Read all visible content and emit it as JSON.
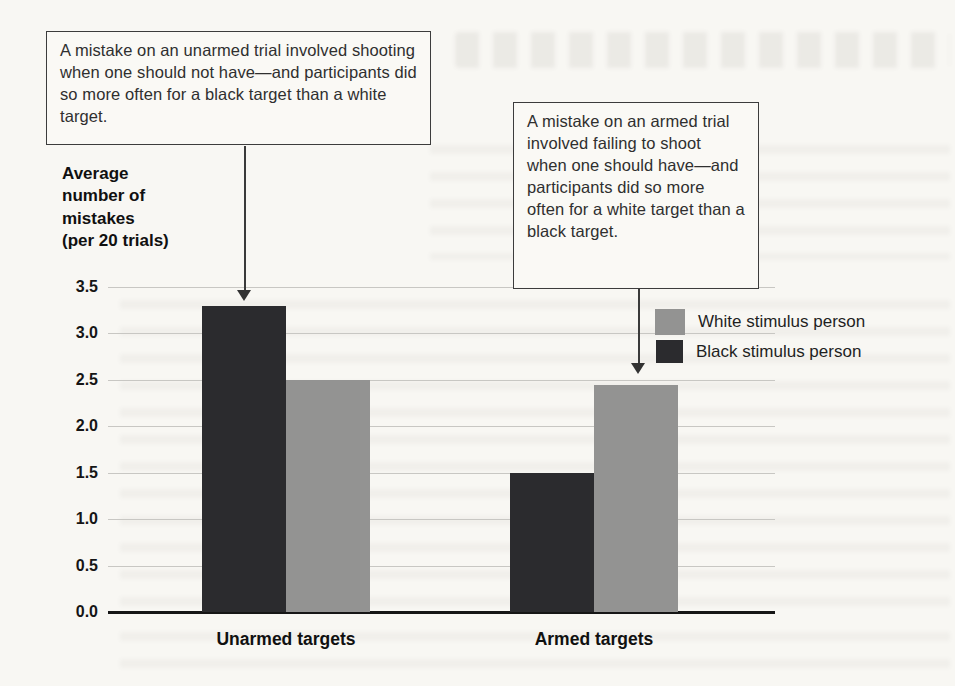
{
  "colors": {
    "background": "#f8f7f3",
    "grid": "#c8c7c3",
    "axis_line": "#161616",
    "text": "#1c1c1c",
    "annotation_border": "#3c3c3c",
    "bar_black_stimulus": "#2b2b2e",
    "bar_white_stimulus": "#939392"
  },
  "annotations": {
    "unarmed_note": {
      "text": "A mistake on an unarmed trial involved shooting when one should not have—and participants did so more often for a black target than a white target.",
      "arrow_points_to": "unarmed-black-stimulus-bar"
    },
    "armed_note": {
      "text": "A mistake on an armed trial involved failing to shoot when one should have—and participants did so more often for a white target than a black target.",
      "arrow_points_to": "armed-white-stimulus-bar"
    }
  },
  "chart_data": {
    "type": "bar",
    "title": "",
    "xlabel": "",
    "ylabel": "Average number of mistakes (per 20 trials)",
    "ylabel_lines": [
      "Average",
      "number of",
      "mistakes",
      "(per 20 trials)"
    ],
    "categories": [
      "Unarmed targets",
      "Armed targets"
    ],
    "series": [
      {
        "name": "Black stimulus person",
        "color": "#2b2b2e",
        "values": [
          3.3,
          1.5
        ]
      },
      {
        "name": "White stimulus person",
        "color": "#939392",
        "values": [
          2.5,
          2.45
        ]
      }
    ],
    "ylim": [
      0,
      3.5
    ],
    "ytick_step": 0.5,
    "yticks": [
      "3.5",
      "3.0",
      "2.5",
      "2.0",
      "1.5",
      "1.0",
      "0.5",
      "0.0"
    ],
    "grid": true,
    "legend_position": "right-inside",
    "legend_order": [
      "White stimulus person",
      "Black stimulus person"
    ]
  }
}
